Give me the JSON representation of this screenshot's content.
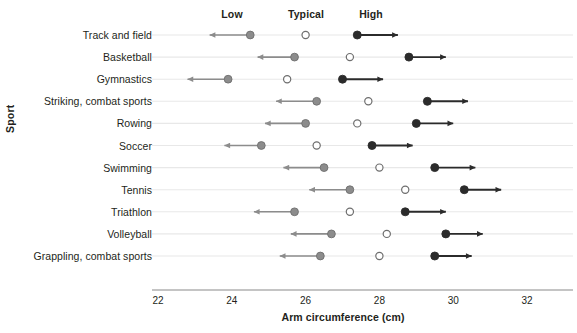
{
  "chart_data": {
    "type": "scatter",
    "title": "",
    "xlabel": "Arm circumference (cm)",
    "ylabel": "Sport",
    "xlim": [
      21.6,
      32.6
    ],
    "xticks": [
      22,
      24,
      26,
      28,
      30,
      32
    ],
    "xticklabels": [
      "22",
      "24",
      "26",
      "28",
      "30",
      "32"
    ],
    "grid": true,
    "legend_position": "top",
    "column_headers": [
      "Low",
      "Typical",
      "High"
    ],
    "series": [
      {
        "name": "Low",
        "marker": "filled-circle-gray",
        "color": "#8c8c8c",
        "arrow": "left"
      },
      {
        "name": "Typical",
        "marker": "open-circle",
        "color": "#ffffff",
        "arrow": "none"
      },
      {
        "name": "High",
        "marker": "filled-circle-dark",
        "color": "#2b2b2b",
        "arrow": "right"
      }
    ],
    "categories": [
      "Track and field",
      "Basketball",
      "Gymnastics",
      "Striking, combat sports",
      "Rowing",
      "Soccer",
      "Swimming",
      "Tennis",
      "Triathlon",
      "Volleyball",
      "Grappling, combat sports"
    ],
    "rows": [
      {
        "sport": "Track and field",
        "low": 24.5,
        "typical": 26.0,
        "high": 27.4,
        "low_arrow_end": 23.4,
        "high_arrow_end": 28.5
      },
      {
        "sport": "Basketball",
        "low": 25.7,
        "typical": 27.2,
        "high": 28.8,
        "low_arrow_end": 24.7,
        "high_arrow_end": 29.8
      },
      {
        "sport": "Gymnastics",
        "low": 23.9,
        "typical": 25.5,
        "high": 27.0,
        "low_arrow_end": 22.8,
        "high_arrow_end": 28.1
      },
      {
        "sport": "Striking, combat sports",
        "low": 26.3,
        "typical": 27.7,
        "high": 29.3,
        "low_arrow_end": 25.2,
        "high_arrow_end": 30.4
      },
      {
        "sport": "Rowing",
        "low": 26.0,
        "typical": 27.4,
        "high": 29.0,
        "low_arrow_end": 24.9,
        "high_arrow_end": 30.0
      },
      {
        "sport": "Soccer",
        "low": 24.8,
        "typical": 26.3,
        "high": 27.8,
        "low_arrow_end": 23.8,
        "high_arrow_end": 28.9
      },
      {
        "sport": "Swimming",
        "low": 26.5,
        "typical": 28.0,
        "high": 29.5,
        "low_arrow_end": 25.4,
        "high_arrow_end": 30.6
      },
      {
        "sport": "Tennis",
        "low": 27.2,
        "typical": 28.7,
        "high": 30.3,
        "low_arrow_end": 26.1,
        "high_arrow_end": 31.3
      },
      {
        "sport": "Triathlon",
        "low": 25.7,
        "typical": 27.2,
        "high": 28.7,
        "low_arrow_end": 24.6,
        "high_arrow_end": 29.8
      },
      {
        "sport": "Volleyball",
        "low": 26.7,
        "typical": 28.2,
        "high": 29.8,
        "low_arrow_end": 25.6,
        "high_arrow_end": 30.8
      },
      {
        "sport": "Grappling, combat sports",
        "low": 26.4,
        "typical": 28.0,
        "high": 29.5,
        "low_arrow_end": 25.3,
        "high_arrow_end": 30.5
      }
    ]
  },
  "headers": {
    "low": "Low",
    "typical": "Typical",
    "high": "High"
  },
  "axes": {
    "x_title": "Arm circumference (cm)",
    "y_title": "Sport"
  },
  "colors": {
    "low_marker": "#8c8c8c",
    "typical_marker_stroke": "#6e6e6e",
    "high_marker": "#2b2b2b",
    "gridline": "#e8e8e8",
    "axis": "#8a8a8a",
    "text": "#231f20"
  }
}
